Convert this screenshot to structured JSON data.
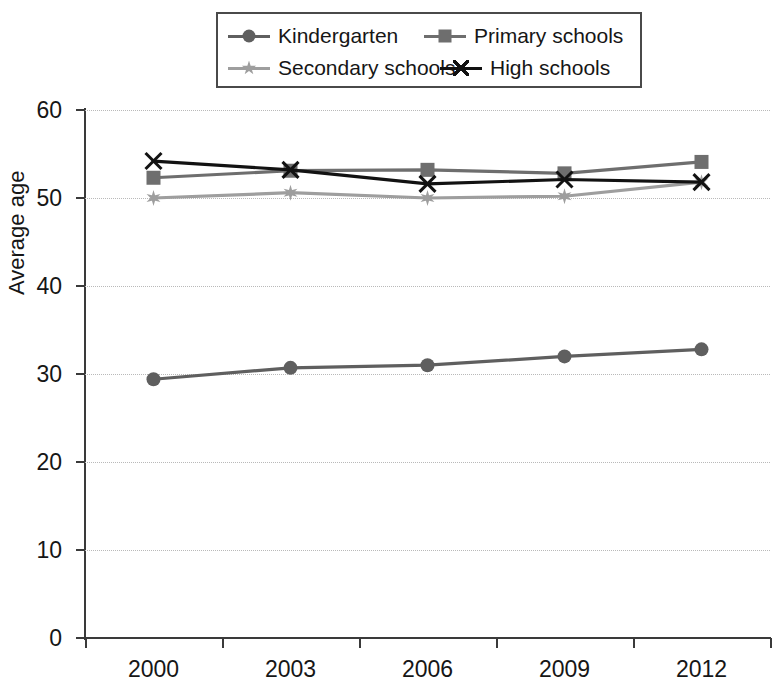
{
  "chart_data": {
    "type": "line",
    "title": "",
    "xlabel": "",
    "ylabel": "Average age",
    "categories": [
      "2000",
      "2003",
      "2006",
      "2009",
      "2012"
    ],
    "x": [
      2000,
      2003,
      2006,
      2009,
      2012
    ],
    "ylim": [
      0,
      60
    ],
    "yticks": [
      0,
      10,
      20,
      30,
      40,
      50,
      60
    ],
    "grid": "horizontal-dotted",
    "legend_position": "top-center",
    "series": [
      {
        "name": "Kindergarten",
        "marker": "circle",
        "color": "#5f5f5f",
        "values": [
          29.4,
          30.7,
          31.0,
          32.0,
          32.8
        ]
      },
      {
        "name": "Primary schools",
        "marker": "square",
        "color": "#6e6e6e",
        "values": [
          52.3,
          53.1,
          53.2,
          52.8,
          54.1
        ]
      },
      {
        "name": "Secondary schools",
        "marker": "star",
        "color": "#9e9e9e",
        "values": [
          50.0,
          50.6,
          50.0,
          50.2,
          51.8
        ]
      },
      {
        "name": "High schools",
        "marker": "x",
        "color": "#121212",
        "values": [
          54.2,
          53.2,
          51.6,
          52.1,
          51.8
        ]
      }
    ]
  },
  "legend": {
    "entries": [
      {
        "label": "Kindergarten"
      },
      {
        "label": "Primary schools"
      },
      {
        "label": "Secondary schools"
      },
      {
        "label": "High schools"
      }
    ]
  },
  "axes": {
    "y": {
      "title": "Average age",
      "tick_labels": [
        "60",
        "50",
        "40",
        "30",
        "20",
        "10",
        "0"
      ]
    },
    "x": {
      "tick_labels": [
        "2000",
        "2003",
        "2006",
        "2009",
        "2012"
      ]
    }
  }
}
